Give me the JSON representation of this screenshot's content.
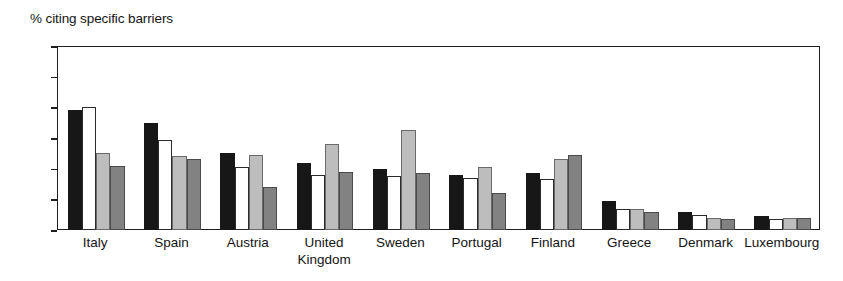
{
  "chart_data": {
    "type": "bar",
    "title": "% citing specific barriers",
    "xlabel": "",
    "ylabel": "% citing specific barriers",
    "ylim": [
      0,
      60
    ],
    "yticks": [
      0,
      10,
      20,
      30,
      40,
      50,
      60
    ],
    "grid": false,
    "legend": "none",
    "categories": [
      "Italy",
      "Spain",
      "Austria",
      "United\nKingdom",
      "Sweden",
      "Portugal",
      "Finland",
      "Greece",
      "Denmark",
      "Luxembourg"
    ],
    "series": [
      {
        "name": "series-1",
        "color": "#171717",
        "values": [
          39,
          35,
          25,
          22,
          20,
          18,
          18.5,
          9.5,
          6,
          4.5
        ]
      },
      {
        "name": "series-2",
        "color": "#ffffff",
        "values": [
          40,
          29.5,
          20.5,
          18,
          17.5,
          17,
          16.5,
          7,
          5,
          3.5
        ]
      },
      {
        "name": "series-3",
        "color": "#bdbdbd",
        "values": [
          25,
          24,
          24.5,
          28,
          32.5,
          20.5,
          23,
          7,
          4,
          4
        ]
      },
      {
        "name": "series-4",
        "color": "#828282",
        "values": [
          21,
          23,
          14,
          19,
          18.5,
          12,
          24.5,
          6,
          3.5,
          4
        ]
      }
    ]
  }
}
